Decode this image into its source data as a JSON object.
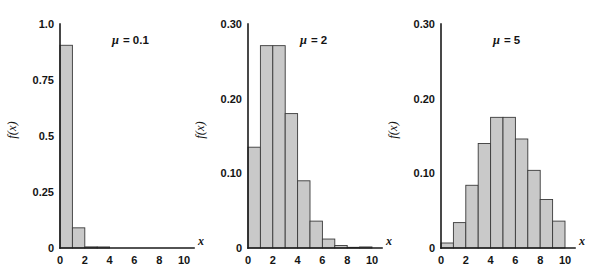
{
  "figure": {
    "background_color": "#ffffff",
    "bar_fill_color": "#c9c9c9",
    "bar_edge_color": "#3a3a3a",
    "axis_color": "#1a1a1a",
    "panel_count": 3
  },
  "chart_data": [
    {
      "type": "bar",
      "title": "",
      "annotation": "μ = 0.1",
      "annotation_symbol": "μ",
      "annotation_value": "0.1",
      "xlabel": "x",
      "ylabel": "f(x)",
      "x": [
        0,
        1,
        2,
        3,
        4,
        5,
        6,
        7,
        8,
        9
      ],
      "categories": [
        "0",
        "1",
        "2",
        "3",
        "4",
        "5",
        "6",
        "7",
        "8",
        "9"
      ],
      "values": [
        0.905,
        0.09,
        0.005,
        0.0002,
        0.0,
        0.0,
        0.0,
        0.0,
        0.0,
        0.0
      ],
      "xlim": [
        0,
        10
      ],
      "ylim": [
        0,
        1.0
      ],
      "xticks": [
        0,
        2,
        4,
        6,
        8,
        10
      ],
      "xtick_labels": [
        "0",
        "2",
        "4",
        "6",
        "8",
        "10"
      ],
      "yticks": [
        0,
        0.25,
        0.5,
        0.75,
        1.0
      ],
      "ytick_labels": [
        "0",
        "0.25",
        "0.5",
        "0.75",
        "1.0"
      ],
      "grid": false,
      "legend": "none",
      "bar_align": "edge",
      "bar_width": 1
    },
    {
      "type": "bar",
      "title": "",
      "annotation": "μ = 2",
      "annotation_symbol": "μ",
      "annotation_value": "2",
      "xlabel": "x",
      "ylabel": "f(x)",
      "x": [
        0,
        1,
        2,
        3,
        4,
        5,
        6,
        7,
        8,
        9
      ],
      "categories": [
        "0",
        "1",
        "2",
        "3",
        "4",
        "5",
        "6",
        "7",
        "8",
        "9"
      ],
      "values": [
        0.135,
        0.271,
        0.271,
        0.18,
        0.09,
        0.036,
        0.012,
        0.0034,
        0.0009,
        0.0002
      ],
      "xlim": [
        0,
        10
      ],
      "ylim": [
        0,
        0.3
      ],
      "xticks": [
        0,
        2,
        4,
        6,
        8,
        10
      ],
      "xtick_labels": [
        "0",
        "2",
        "4",
        "6",
        "8",
        "10"
      ],
      "yticks": [
        0,
        0.1,
        0.2,
        0.3
      ],
      "ytick_labels": [
        "0",
        "0.10",
        "0.20",
        "0.30"
      ],
      "grid": false,
      "legend": "none",
      "bar_align": "edge",
      "bar_width": 1
    },
    {
      "type": "bar",
      "title": "",
      "annotation": "μ = 5",
      "annotation_symbol": "μ",
      "annotation_value": "5",
      "xlabel": "x",
      "ylabel": "f(x)",
      "x": [
        0,
        1,
        2,
        3,
        4,
        5,
        6,
        7,
        8,
        9
      ],
      "categories": [
        "0",
        "1",
        "2",
        "3",
        "4",
        "5",
        "6",
        "7",
        "8",
        "9"
      ],
      "values": [
        0.0067,
        0.034,
        0.084,
        0.14,
        0.175,
        0.175,
        0.146,
        0.104,
        0.065,
        0.036
      ],
      "xlim": [
        0,
        10
      ],
      "ylim": [
        0,
        0.3
      ],
      "xticks": [
        0,
        2,
        4,
        6,
        8,
        10
      ],
      "xtick_labels": [
        "0",
        "2",
        "4",
        "6",
        "8",
        "10"
      ],
      "yticks": [
        0,
        0.1,
        0.2,
        0.3
      ],
      "ytick_labels": [
        "0",
        "0.10",
        "0.20",
        "0.30"
      ],
      "grid": false,
      "legend": "none",
      "bar_align": "edge",
      "bar_width": 1
    }
  ],
  "layout": {
    "panels": [
      {
        "origin_x": 60,
        "origin_y": 248,
        "plot_width": 124,
        "plot_height": 224,
        "axis_top_y": 24
      },
      {
        "origin_x": 248,
        "origin_y": 248,
        "plot_width": 124,
        "plot_height": 224,
        "axis_top_y": 24
      },
      {
        "origin_x": 441,
        "origin_y": 248,
        "plot_width": 124,
        "plot_height": 224,
        "axis_top_y": 24
      }
    ],
    "annotation_offsets": {
      "dx": 52,
      "dy": -204
    },
    "ylabel_offset_x": -44,
    "ylabel_offset_y": -118
  }
}
